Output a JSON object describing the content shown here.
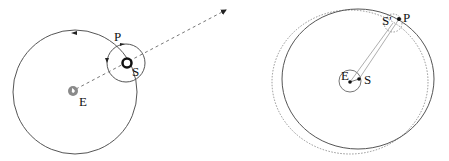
{
  "left_diagram": {
    "title": "Epicycle model",
    "labels": {
      "earth": "E",
      "sun": "S",
      "planet": "P"
    },
    "deferent": {
      "cx": 75,
      "cy": 92,
      "r": 62
    },
    "epicycle": {
      "cx": 126,
      "cy": 63,
      "r": 19
    },
    "earth": {
      "cx": 73,
      "cy": 91,
      "r": 5
    },
    "sun": {
      "cx": 127,
      "cy": 63,
      "r": 4.5
    },
    "line_of_sight": {
      "from": [
        73,
        91
      ],
      "to": [
        228,
        9
      ],
      "style": "dashed"
    },
    "colors": {
      "stroke": "#555555",
      "earth_fill": "#8a8a8a",
      "sun_stroke": "#111111"
    }
  },
  "right_diagram": {
    "title": "Eccentric orbit model",
    "labels": {
      "earth": "E",
      "sun": "S",
      "sun_prime": "S'",
      "planet": "P"
    },
    "solid_orbit": {
      "cx": 358,
      "cy": 79,
      "rx": 76,
      "ry": 70
    },
    "dotted_orbit": {
      "cx": 350,
      "cy": 82,
      "rx": 78,
      "ry": 72
    },
    "earth_circle": {
      "cx": 350,
      "cy": 81,
      "r": 11
    },
    "earth": {
      "cx": 350,
      "cy": 82
    },
    "sun": {
      "cx": 359,
      "cy": 79
    },
    "planet": {
      "cx": 399,
      "cy": 19
    },
    "sun_prime_circle": {
      "cx": 393,
      "cy": 23,
      "r": 9
    },
    "colors": {
      "stroke": "#555555",
      "dotted": "#888888",
      "dot": "#111111"
    }
  }
}
